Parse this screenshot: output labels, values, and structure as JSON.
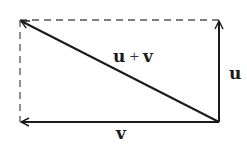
{
  "diagram": {
    "colors": {
      "stroke": "#1a1a1a",
      "dashed": "#555555",
      "background": "#ffffff"
    },
    "points": {
      "top_left": [
        20,
        20
      ],
      "top_right": [
        219,
        20
      ],
      "bottom_left": [
        20,
        122
      ],
      "bottom_right": [
        219,
        122
      ]
    },
    "vectors": [
      {
        "id": "u",
        "label": "u",
        "from": "bottom_right",
        "to": "top_right"
      },
      {
        "id": "v",
        "label": "v",
        "from": "bottom_right",
        "to": "bottom_left"
      },
      {
        "id": "sum",
        "label_left": "u",
        "label_op": "+",
        "label_right": "v",
        "from": "bottom_right",
        "to": "top_left"
      }
    ],
    "dashed_edges": [
      {
        "from": "top_left",
        "to": "top_right"
      },
      {
        "from": "top_left",
        "to": "bottom_left"
      }
    ]
  }
}
